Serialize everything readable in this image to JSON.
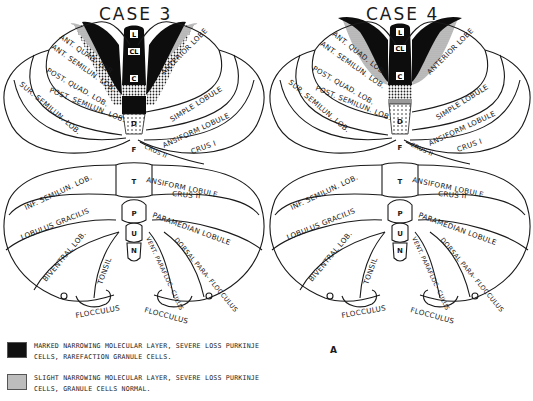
{
  "figure": {
    "panel_letter": "A",
    "cases": [
      {
        "title": "CASE 3",
        "vermis_labels": [
          "L",
          "CL",
          "C",
          "D",
          "F",
          "T",
          "P",
          "U",
          "N"
        ],
        "upper_left_labels": [
          "ANT. QUAD. LOB.",
          "ANT. SEMILUN. LOB.",
          "POST. QUAD. LOB.",
          "POST. SEMILUN. LOB.",
          "SUR. SEMILUN. LOB."
        ],
        "upper_right_labels": [
          "ANTERIOR LOBE",
          "SIMPLE LOBULE",
          "ANSIFORM LOBULE",
          "CRUS I",
          "CRUS II"
        ],
        "lower_left_labels": [
          "INF. SEMILUN. LOB.",
          "LOBULUS GRACILIS",
          "BIVENTRAL LOB.",
          "TONSIL",
          "FLOCCULUS"
        ],
        "lower_right_labels": [
          "ANSIFORM LOBULE",
          "CRUS II",
          "PARAMEDIAN LOBULE",
          "VENT. PARAFLOC- CULUS",
          "DORSAL PARA- FLOCCULUS",
          "FLOCCULUS"
        ]
      },
      {
        "title": "CASE 4",
        "vermis_labels": [
          "L",
          "CL",
          "C",
          "D",
          "F",
          "T",
          "P",
          "U",
          "N"
        ],
        "upper_left_labels": [
          "ANT. QUAD. LOB.",
          "ANT. SEMILUN. LOB.",
          "POST. QUAD. LOB.",
          "POST. SEMILUN. LOB.",
          "SUR. SEMILUN. LOB."
        ],
        "upper_right_labels": [
          "ANTERIOR LOBE",
          "SIMPLE LOBULE",
          "ANSIFORM LOBULE",
          "CRUS I",
          "CRUS II"
        ],
        "lower_left_labels": [
          "INF. SEMILUN. LOB.",
          "LOBULUS GRACILIS",
          "BIVENTRAL LOB.",
          "TONSIL",
          "FLOCCULUS"
        ],
        "lower_right_labels": [
          "ANSIFORM LOBULE",
          "CRUS II",
          "PARAMEDIAN LOBULE",
          "VENT. PARAFLOC- CULUS",
          "DORSAL PARA- FLOCCULUS",
          "FLOCCULUS"
        ]
      }
    ],
    "legend": [
      {
        "swatch": "black",
        "color": "#111111",
        "line1": "MARKED NARROWING MOLECULAR LAYER, SEVERE LOSS PURKINJE",
        "line2": "CELLS, RAREFACTION GRANULE CELLS."
      },
      {
        "swatch": "grey",
        "color": "#b8b8b8",
        "line1": "SLIGHT NARROWING MOLECULAR LAYER, SEVERE LOSS PURKINJE",
        "line2": "CELLS, GRANULE CELLS NORMAL."
      }
    ]
  }
}
